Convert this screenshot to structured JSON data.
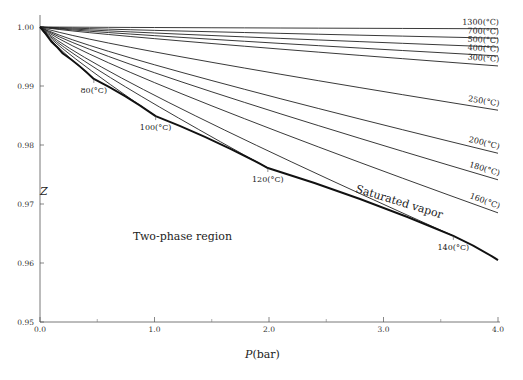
{
  "chart_data": {
    "type": "line",
    "title": "",
    "xlabel": "P(bar)",
    "ylabel": "Z",
    "xlim": [
      0.0,
      4.0
    ],
    "ylim": [
      0.95,
      1.0
    ],
    "x_ticks": [
      "0.0",
      "1.0",
      "2.0",
      "3.0",
      "4.0"
    ],
    "y_ticks": [
      "1.00",
      "0.99",
      "0.98",
      "0.97",
      "0.96",
      "0.95"
    ],
    "grid": false,
    "annotations": [
      {
        "text": "Two-phase region",
        "x": 1.0,
        "y": 0.9645
      },
      {
        "text": "Saturated vapor",
        "x": 2.6,
        "y": 0.973,
        "rotation": -16
      }
    ],
    "saturated_vapor": {
      "name": "Saturated vapor",
      "P": [
        0.0,
        0.1,
        0.2,
        0.47,
        1.01,
        1.99,
        3.61,
        4.0
      ],
      "Z": [
        1.0,
        0.9975,
        0.9955,
        0.9912,
        0.9849,
        0.9761,
        0.9646,
        0.9605
      ]
    },
    "series": [
      {
        "name": "80(°C)",
        "P": [
          0.0,
          0.47
        ],
        "Z": [
          1.0,
          0.9912
        ],
        "label_pos": [
          0.47,
          0.9905
        ]
      },
      {
        "name": "100(°C)",
        "P": [
          0.0,
          1.01
        ],
        "Z": [
          1.0,
          0.9849
        ],
        "label_pos": [
          1.01,
          0.9842
        ]
      },
      {
        "name": "120(°C)",
        "P": [
          0.0,
          1.99
        ],
        "Z": [
          1.0,
          0.9761
        ],
        "label_pos": [
          1.99,
          0.9754
        ]
      },
      {
        "name": "140(°C)",
        "P": [
          0.0,
          3.61
        ],
        "Z": [
          1.0,
          0.9646
        ],
        "label_pos": [
          3.61,
          0.9639
        ]
      },
      {
        "name": "160(°C)",
        "P": [
          0.0,
          4.0
        ],
        "Z": [
          1.0,
          0.9685
        ]
      },
      {
        "name": "180(°C)",
        "P": [
          0.0,
          4.0
        ],
        "Z": [
          1.0,
          0.9741
        ]
      },
      {
        "name": "200(°C)",
        "P": [
          0.0,
          4.0
        ],
        "Z": [
          1.0,
          0.9786
        ]
      },
      {
        "name": "250(°C)",
        "P": [
          0.0,
          4.0
        ],
        "Z": [
          1.0,
          0.9859
        ]
      },
      {
        "name": "300(°C)",
        "P": [
          0.0,
          4.0
        ],
        "Z": [
          1.0,
          0.9934
        ]
      },
      {
        "name": "400(°C)",
        "P": [
          0.0,
          4.0
        ],
        "Z": [
          1.0,
          0.9951
        ]
      },
      {
        "name": "500(°C)",
        "P": [
          0.0,
          4.0
        ],
        "Z": [
          1.0,
          0.9966
        ]
      },
      {
        "name": "700(°C)",
        "P": [
          0.0,
          4.0
        ],
        "Z": [
          1.0,
          0.9981
        ]
      },
      {
        "name": "1300(°C)",
        "P": [
          0.0,
          4.0
        ],
        "Z": [
          1.0,
          0.9997
        ]
      }
    ]
  },
  "labels": {
    "xlabel_italic": "P",
    "xlabel_unit": "(bar)",
    "ylabel": "Z",
    "two_phase": "Two-phase region",
    "saturated": "Saturated vapor"
  }
}
